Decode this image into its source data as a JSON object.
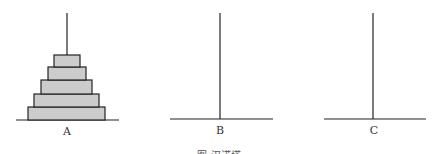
{
  "figure": {
    "caption": "图   汉诺塔",
    "colors": {
      "line": "#222222",
      "disk_fill": "#cccccc",
      "disk_stroke": "#222222"
    },
    "pegs": [
      {
        "label": "A",
        "x": 67,
        "base_x1": 16,
        "base_x2": 119,
        "base_y": 120,
        "top_y": 13,
        "disks": 5
      },
      {
        "label": "B",
        "x": 220,
        "base_x1": 170,
        "base_x2": 273,
        "base_y": 119,
        "top_y": 13,
        "disks": 0
      },
      {
        "label": "C",
        "x": 373,
        "base_x1": 324,
        "base_x2": 426,
        "base_y": 119,
        "top_y": 13,
        "disks": 0
      }
    ],
    "disks": [
      {
        "peg": "A",
        "x1": 28,
        "x2": 105,
        "y1": 107,
        "y2": 120
      },
      {
        "peg": "A",
        "x1": 34,
        "x2": 99,
        "y1": 94,
        "y2": 107
      },
      {
        "peg": "A",
        "x1": 41,
        "x2": 92,
        "y1": 80,
        "y2": 94
      },
      {
        "peg": "A",
        "x1": 48,
        "x2": 86,
        "y1": 67,
        "y2": 80
      },
      {
        "peg": "A",
        "x1": 54,
        "x2": 80,
        "y1": 55,
        "y2": 67
      }
    ]
  }
}
